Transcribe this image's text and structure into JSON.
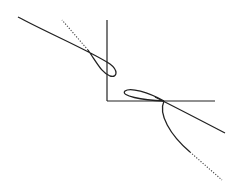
{
  "figure": {
    "colors": {
      "background": "#ffffff",
      "curve": "#222222",
      "axis": "#222222",
      "dotted": "#555555"
    },
    "axes": {
      "vertical": {
        "x": 107,
        "y1": 20,
        "y2": 101
      },
      "horizontal": {
        "y": 101,
        "x1": 107,
        "x2": 215
      }
    },
    "curves": [
      {
        "name": "upper-left-curve",
        "solid_path": "M 18 17 C 50 35, 90 52, 112 66 C 118 70, 118 77, 108 75 C 100 72, 96 66, 63 24",
        "dotted_from": [
          63,
          24
        ],
        "dotted_to": [
          88,
          47
        ]
      },
      {
        "name": "lower-right-curve",
        "loop_path": "M 164 101 C 150 93, 128 87, 124 92 C 120 97, 140 100, 164 101",
        "branch_solid_path": "M 164 101 C 185 112, 205 124, 222 133",
        "branch_lower_path": "M 164 101 C 158 115, 172 138, 192 155",
        "dotted_from": [
          192,
          155
        ],
        "dotted_to": [
          222,
          178
        ]
      }
    ]
  }
}
